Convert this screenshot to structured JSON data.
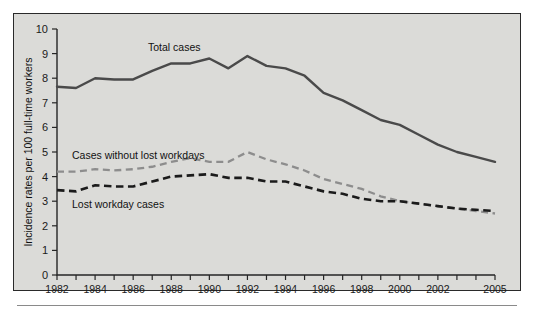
{
  "figure": {
    "background_color": "#d9d9d6",
    "frame_color": "#2a2a2a"
  },
  "labels": {
    "total_cases": "Total cases",
    "cases_without_lost_workdays": "Cases without lost workdays",
    "lost_workday_cases": "Lost workday cases",
    "y_axis_title": "Incidence rates per 100 full-time workers"
  },
  "chart_data": {
    "type": "line",
    "title": "",
    "xlabel": "",
    "ylabel": "Incidence rates per 100 full-time workers",
    "xlim": [
      1982,
      2005
    ],
    "ylim": [
      0,
      10
    ],
    "grid": false,
    "legend": "inline-annotations",
    "x": [
      1982,
      1983,
      1984,
      1985,
      1986,
      1987,
      1988,
      1989,
      1990,
      1991,
      1992,
      1993,
      1994,
      1995,
      1996,
      1997,
      1998,
      1999,
      2000,
      2001,
      2002,
      2003,
      2004,
      2005
    ],
    "x_tick_labels": [
      "1982",
      "1983",
      "1984",
      "1985",
      "1986",
      "1987",
      "1988",
      "1989",
      "1990",
      "1991",
      "1992",
      "1993",
      "1994",
      "1995",
      "1996",
      "1997",
      "1998",
      "1999",
      "2000",
      "2001",
      "2002",
      "2003",
      "2004",
      "2005"
    ],
    "x_major_tick_labels": [
      "1982",
      "1984",
      "1986",
      "1988",
      "1990",
      "1992",
      "1994",
      "1996",
      "1998",
      "2000",
      "2002",
      "2005"
    ],
    "y_tick_labels": [
      "0",
      "1",
      "2",
      "3",
      "4",
      "5",
      "6",
      "7",
      "8",
      "9",
      "10"
    ],
    "series": [
      {
        "name": "Total cases",
        "style": "solid",
        "color": "#4a4a4a",
        "values": [
          7.65,
          7.6,
          8.0,
          7.95,
          7.95,
          8.3,
          8.6,
          8.6,
          8.8,
          8.4,
          8.9,
          8.5,
          8.4,
          8.1,
          7.4,
          7.1,
          6.7,
          6.3,
          6.1,
          5.7,
          5.3,
          5.0,
          4.8,
          4.6
        ]
      },
      {
        "name": "Cases without lost workdays",
        "style": "dashed",
        "color": "#8d8d8d",
        "values": [
          4.2,
          4.2,
          4.3,
          4.25,
          4.3,
          4.4,
          4.6,
          4.75,
          4.6,
          4.6,
          5.0,
          4.7,
          4.5,
          4.25,
          3.9,
          3.7,
          3.5,
          3.2,
          3.0,
          2.9,
          2.8,
          2.7,
          2.6,
          2.5
        ]
      },
      {
        "name": "Lost workday cases",
        "style": "dashed",
        "color": "#1b1b1b",
        "values": [
          3.45,
          3.4,
          3.65,
          3.6,
          3.6,
          3.8,
          4.0,
          4.05,
          4.1,
          3.95,
          3.95,
          3.8,
          3.8,
          3.6,
          3.4,
          3.3,
          3.1,
          3.0,
          3.0,
          2.9,
          2.8,
          2.7,
          2.65,
          2.6
        ]
      }
    ]
  }
}
